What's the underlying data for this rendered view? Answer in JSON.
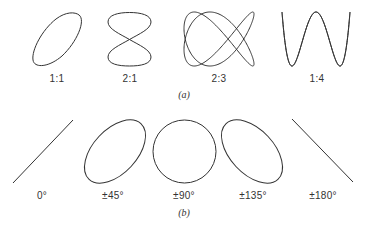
{
  "figure": {
    "part_a": {
      "caption": "(a)",
      "title": "Lissajous figures for frequency ratios",
      "items": [
        {
          "label": "1:1",
          "ratio_y": 1,
          "ratio_x": 1
        },
        {
          "label": "2:1",
          "ratio_y": 2,
          "ratio_x": 1
        },
        {
          "label": "2:3",
          "ratio_y": 2,
          "ratio_x": 3
        },
        {
          "label": "1:4",
          "ratio_y": 1,
          "ratio_x": 4
        }
      ]
    },
    "part_b": {
      "caption": "(b)",
      "title": "Lissajous figures for phase differences (1:1)",
      "items": [
        {
          "label": "0°",
          "shape": "line-rising"
        },
        {
          "label": "±45°",
          "shape": "ellipse-rising"
        },
        {
          "label": "±90°",
          "shape": "circle"
        },
        {
          "label": "±135°",
          "shape": "ellipse-falling"
        },
        {
          "label": "±180°",
          "shape": "line-falling"
        }
      ]
    },
    "stroke_color": "#333333",
    "background": "#ffffff"
  }
}
